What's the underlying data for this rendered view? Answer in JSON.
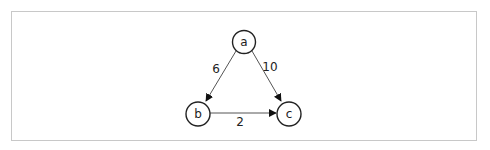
{
  "diagram": {
    "type": "directed-weighted-graph",
    "colors": {
      "border": "#c8c8c8",
      "stroke": "#222222",
      "edge": "#555555",
      "background": "#ffffff"
    },
    "nodes": [
      {
        "id": "a",
        "label": "a",
        "x": 244,
        "y": 42
      },
      {
        "id": "b",
        "label": "b",
        "x": 198,
        "y": 114
      },
      {
        "id": "c",
        "label": "c",
        "x": 289,
        "y": 114
      }
    ],
    "edges": [
      {
        "from": "a",
        "to": "b",
        "weight": "6",
        "label_x": 216,
        "label_y": 73
      },
      {
        "from": "a",
        "to": "c",
        "weight": "10",
        "label_x": 270,
        "label_y": 71
      },
      {
        "from": "b",
        "to": "c",
        "weight": "2",
        "label_x": 240,
        "label_y": 126
      }
    ]
  }
}
